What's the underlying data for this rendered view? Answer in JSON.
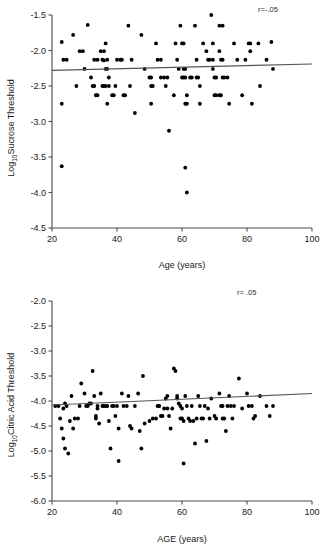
{
  "figure": {
    "background": "#ffffff",
    "point_color": "#000000",
    "axis_color": "#4d4d4d",
    "line_color": "#555555"
  },
  "chart_data": [
    {
      "id": "sucrose",
      "type": "scatter",
      "title": "",
      "xlabel": "Age (years)",
      "ylabel": "Log 10 Sucrose Threshold",
      "ylabel_main": "Sucrose Threshold",
      "ylabel_prefix": "Log",
      "ylabel_subscript": "10",
      "xlim": [
        20,
        100
      ],
      "ylim": [
        -4.5,
        -1.5
      ],
      "xticks": [
        20,
        40,
        60,
        80,
        100
      ],
      "xtick_labels": [
        "20",
        "40",
        "60",
        "80",
        "100"
      ],
      "yticks": [
        -1.5,
        -2.0,
        -2.5,
        -3.0,
        -3.5,
        -4.0,
        -4.5
      ],
      "ytick_labels": [
        "-1.5",
        "-2.0",
        "-2.5",
        "-3.0",
        "-3.5",
        "-4.0",
        "-4.5"
      ],
      "grid": false,
      "legend": null,
      "annotation": "r=-.05",
      "annotation_position": "top-right",
      "fit_line": {
        "x": [
          20,
          100
        ],
        "y": [
          -2.28,
          -2.19
        ],
        "slope": 0.001125,
        "intercept": -2.3025
      },
      "points": [
        [
          23.0,
          -1.88
        ],
        [
          23.5,
          -2.13
        ],
        [
          24.5,
          -2.13
        ],
        [
          23.0,
          -2.75
        ],
        [
          23.0,
          -3.63
        ],
        [
          26.5,
          -1.78
        ],
        [
          27.5,
          -2.5
        ],
        [
          28.5,
          -2.01
        ],
        [
          29.5,
          -2.01
        ],
        [
          30.0,
          -2.26
        ],
        [
          31.0,
          -1.64
        ],
        [
          32.0,
          -2.38
        ],
        [
          32.5,
          -2.5
        ],
        [
          33.0,
          -2.5
        ],
        [
          33.5,
          -2.63
        ],
        [
          34.0,
          -2.63
        ],
        [
          33.0,
          -2.13
        ],
        [
          34.0,
          -2.13
        ],
        [
          35.0,
          -2.01
        ],
        [
          36.0,
          -2.01
        ],
        [
          35.5,
          -2.13
        ],
        [
          36.0,
          -2.14
        ],
        [
          36.5,
          -2.26
        ],
        [
          36.5,
          -1.9
        ],
        [
          37.0,
          -2.13
        ],
        [
          37.0,
          -2.26
        ],
        [
          37.5,
          -2.38
        ],
        [
          37.5,
          -2.5
        ],
        [
          36.0,
          -2.5
        ],
        [
          36.5,
          -2.5
        ],
        [
          35.5,
          -2.5
        ],
        [
          37.0,
          -2.75
        ],
        [
          38.5,
          -2.63
        ],
        [
          39.0,
          -2.63
        ],
        [
          39.5,
          -2.5
        ],
        [
          40.0,
          -2.13
        ],
        [
          41.0,
          -2.13
        ],
        [
          41.5,
          -2.13
        ],
        [
          42.0,
          -2.63
        ],
        [
          42.5,
          -2.63
        ],
        [
          43.5,
          -1.65
        ],
        [
          44.5,
          -2.13
        ],
        [
          44.0,
          -2.5
        ],
        [
          45.5,
          -2.88
        ],
        [
          47.5,
          -1.78
        ],
        [
          48.5,
          -2.26
        ],
        [
          50.0,
          -2.38
        ],
        [
          50.5,
          -2.38
        ],
        [
          50.5,
          -2.5
        ],
        [
          51.0,
          -2.5
        ],
        [
          50.5,
          -2.75
        ],
        [
          52.0,
          -1.9
        ],
        [
          52.5,
          -2.13
        ],
        [
          53.5,
          -2.13
        ],
        [
          53.5,
          -2.38
        ],
        [
          54.5,
          -2.38
        ],
        [
          55.5,
          -2.38
        ],
        [
          55.0,
          -2.5
        ],
        [
          56.0,
          -3.13
        ],
        [
          57.5,
          -2.63
        ],
        [
          58.0,
          -1.9
        ],
        [
          58.5,
          -2.13
        ],
        [
          59.0,
          -2.26
        ],
        [
          59.5,
          -1.65
        ],
        [
          60.0,
          -1.9
        ],
        [
          60.5,
          -1.9
        ],
        [
          60.5,
          -2.26
        ],
        [
          61.0,
          -2.26
        ],
        [
          60.0,
          -2.38
        ],
        [
          60.5,
          -2.38
        ],
        [
          61.0,
          -2.38
        ],
        [
          61.5,
          -2.63
        ],
        [
          61.0,
          -2.75
        ],
        [
          61.5,
          -2.75
        ],
        [
          61.0,
          -3.65
        ],
        [
          61.5,
          -4.0
        ],
        [
          62.5,
          -2.38
        ],
        [
          63.0,
          -2.38
        ],
        [
          64.0,
          -1.65
        ],
        [
          64.5,
          -2.13
        ],
        [
          64.5,
          -2.38
        ],
        [
          65.0,
          -2.38
        ],
        [
          65.5,
          -2.5
        ],
        [
          65.5,
          -2.75
        ],
        [
          66.5,
          -1.9
        ],
        [
          67.5,
          -2.01
        ],
        [
          68.0,
          -2.13
        ],
        [
          68.5,
          -2.13
        ],
        [
          69.0,
          -1.5
        ],
        [
          69.5,
          -1.9
        ],
        [
          69.5,
          -2.13
        ],
        [
          69.5,
          -2.26
        ],
        [
          70.0,
          -2.38
        ],
        [
          70.5,
          -2.38
        ],
        [
          70.0,
          -2.63
        ],
        [
          70.5,
          -2.63
        ],
        [
          71.5,
          -1.65
        ],
        [
          72.5,
          -1.65
        ],
        [
          71.5,
          -2.01
        ],
        [
          72.0,
          -2.13
        ],
        [
          72.5,
          -2.13
        ],
        [
          72.5,
          -2.38
        ],
        [
          73.0,
          -2.38
        ],
        [
          71.5,
          -2.63
        ],
        [
          72.0,
          -2.63
        ],
        [
          74.0,
          -2.38
        ],
        [
          74.5,
          -2.75
        ],
        [
          76.0,
          -1.9
        ],
        [
          77.0,
          -2.13
        ],
        [
          78.5,
          -2.63
        ],
        [
          79.5,
          -2.13
        ],
        [
          80.5,
          -1.9
        ],
        [
          81.0,
          -1.9
        ],
        [
          81.0,
          -2.01
        ],
        [
          81.5,
          -2.75
        ],
        [
          83.5,
          -1.9
        ],
        [
          84.0,
          -2.5
        ],
        [
          86.0,
          -2.13
        ],
        [
          87.5,
          -1.88
        ],
        [
          88.0,
          -2.26
        ]
      ]
    },
    {
      "id": "citric",
      "type": "scatter",
      "title": "",
      "xlabel": "AGE (years)",
      "ylabel": "Log 10 Citric Acid Threshold",
      "ylabel_main": "Citric Acid Threshold",
      "ylabel_prefix": "Log",
      "ylabel_subscript": "10",
      "xlim": [
        20,
        100
      ],
      "ylim": [
        -6.0,
        -2.0
      ],
      "xticks": [
        20,
        40,
        60,
        80,
        100
      ],
      "xtick_labels": [
        "20",
        "40",
        "60",
        "80",
        "100"
      ],
      "yticks": [
        -2.0,
        -2.5,
        -3.0,
        -3.5,
        -4.0,
        -4.5,
        -5.0,
        -5.5,
        -6.0
      ],
      "ytick_labels": [
        "-2.0",
        "-2.5",
        "-3.0",
        "-3.5",
        "-4.0",
        "-4.5",
        "-5.0",
        "-5.5",
        "-6.0"
      ],
      "grid": false,
      "legend": null,
      "annotation": "r= .05",
      "annotation_position": "top-right",
      "fit_line": {
        "x": [
          20,
          100
        ],
        "y": [
          -4.08,
          -3.85
        ],
        "slope": 0.002875,
        "intercept": -4.1375
      },
      "points": [
        [
          22.5,
          -4.35
        ],
        [
          23.0,
          -4.55
        ],
        [
          23.5,
          -4.75
        ],
        [
          23.5,
          -4.15
        ],
        [
          24.0,
          -4.05
        ],
        [
          24.5,
          -4.1
        ],
        [
          25.0,
          -5.05
        ],
        [
          25.5,
          -4.4
        ],
        [
          26.0,
          -3.9
        ],
        [
          26.5,
          -4.55
        ],
        [
          27.0,
          -4.35
        ],
        [
          28.0,
          -4.35
        ],
        [
          28.5,
          -4.1
        ],
        [
          29.0,
          -3.65
        ],
        [
          30.0,
          -3.85
        ],
        [
          31.5,
          -4.05
        ],
        [
          32.0,
          -4.05
        ],
        [
          32.5,
          -3.4
        ],
        [
          33.0,
          -3.9
        ],
        [
          33.5,
          -4.3
        ],
        [
          33.5,
          -4.35
        ],
        [
          34.0,
          -4.1
        ],
        [
          34.0,
          -4.15
        ],
        [
          34.5,
          -4.45
        ],
        [
          35.0,
          -3.85
        ],
        [
          35.5,
          -4.1
        ],
        [
          36.0,
          -4.1
        ],
        [
          36.5,
          -4.1
        ],
        [
          37.0,
          -4.1
        ],
        [
          37.5,
          -4.4
        ],
        [
          38.0,
          -4.95
        ],
        [
          38.5,
          -4.1
        ],
        [
          39.0,
          -4.1
        ],
        [
          39.5,
          -4.3
        ],
        [
          40.0,
          -4.1
        ],
        [
          40.5,
          -5.2
        ],
        [
          40.5,
          -4.55
        ],
        [
          41.5,
          -3.85
        ],
        [
          42.0,
          -4.1
        ],
        [
          43.0,
          -4.1
        ],
        [
          43.5,
          -3.9
        ],
        [
          44.0,
          -4.5
        ],
        [
          44.5,
          -4.55
        ],
        [
          45.5,
          -4.1
        ],
        [
          46.5,
          -3.85
        ],
        [
          47.0,
          -4.6
        ],
        [
          47.5,
          -4.95
        ],
        [
          48.0,
          -3.5
        ],
        [
          48.5,
          -4.45
        ],
        [
          50.0,
          -4.4
        ],
        [
          51.0,
          -4.35
        ],
        [
          52.0,
          -4.35
        ],
        [
          52.5,
          -4.1
        ],
        [
          53.0,
          -4.1
        ],
        [
          53.5,
          -4.3
        ],
        [
          54.0,
          -4.3
        ],
        [
          54.5,
          -4.15
        ],
        [
          55.0,
          -3.95
        ],
        [
          55.5,
          -3.9
        ],
        [
          55.5,
          -4.15
        ],
        [
          56.0,
          -4.3
        ],
        [
          56.5,
          -4.55
        ],
        [
          57.0,
          -4.15
        ],
        [
          57.5,
          -3.35
        ],
        [
          58.0,
          -3.4
        ],
        [
          58.5,
          -3.9
        ],
        [
          58.5,
          -3.95
        ],
        [
          59.0,
          -4.05
        ],
        [
          59.5,
          -4.1
        ],
        [
          59.5,
          -4.35
        ],
        [
          60.0,
          -4.15
        ],
        [
          60.0,
          -4.35
        ],
        [
          60.5,
          -4.4
        ],
        [
          60.5,
          -5.25
        ],
        [
          61.0,
          -3.9
        ],
        [
          61.5,
          -4.1
        ],
        [
          62.0,
          -4.35
        ],
        [
          62.5,
          -4.4
        ],
        [
          63.0,
          -4.1
        ],
        [
          63.5,
          -4.4
        ],
        [
          64.0,
          -4.85
        ],
        [
          64.5,
          -4.35
        ],
        [
          65.0,
          -3.9
        ],
        [
          65.5,
          -4.1
        ],
        [
          66.0,
          -4.35
        ],
        [
          66.5,
          -4.35
        ],
        [
          67.0,
          -4.1
        ],
        [
          67.5,
          -4.8
        ],
        [
          68.0,
          -4.15
        ],
        [
          68.5,
          -4.35
        ],
        [
          69.0,
          -3.95
        ],
        [
          70.0,
          -4.3
        ],
        [
          70.5,
          -4.35
        ],
        [
          71.5,
          -3.85
        ],
        [
          72.0,
          -4.1
        ],
        [
          72.5,
          -4.1
        ],
        [
          72.5,
          -4.35
        ],
        [
          73.0,
          -4.35
        ],
        [
          73.5,
          -4.6
        ],
        [
          74.0,
          -4.1
        ],
        [
          74.5,
          -3.9
        ],
        [
          75.0,
          -4.1
        ],
        [
          75.5,
          -4.35
        ],
        [
          76.0,
          -4.1
        ],
        [
          77.5,
          -3.55
        ],
        [
          78.5,
          -4.15
        ],
        [
          80.0,
          -3.85
        ],
        [
          80.5,
          -4.1
        ],
        [
          81.5,
          -4.1
        ],
        [
          82.0,
          -4.35
        ],
        [
          82.5,
          -4.3
        ],
        [
          84.0,
          -3.9
        ],
        [
          86.0,
          -4.1
        ],
        [
          87.0,
          -4.3
        ],
        [
          88.0,
          -4.1
        ],
        [
          21.0,
          -4.1
        ],
        [
          22.0,
          -4.1
        ],
        [
          24.0,
          -4.95
        ],
        [
          30.5,
          -4.1
        ],
        [
          31.0,
          -4.1
        ]
      ]
    }
  ]
}
